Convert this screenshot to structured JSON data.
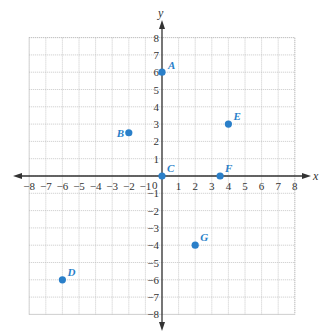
{
  "chart_data": {
    "type": "scatter",
    "title": "",
    "xlabel": "x",
    "ylabel": "y",
    "xlim": [
      -8,
      8
    ],
    "ylim": [
      -8,
      8
    ],
    "grid": true,
    "x_ticks": [
      -8,
      -7,
      -6,
      -5,
      -4,
      -3,
      -2,
      -1,
      1,
      2,
      3,
      4,
      5,
      6,
      7,
      8
    ],
    "y_ticks": [
      8,
      7,
      6,
      5,
      4,
      3,
      2,
      1,
      -1,
      -2,
      -3,
      -4,
      -5,
      -6,
      -7,
      -8
    ],
    "origin_label": "0",
    "series": [
      {
        "name": "points",
        "color": "#2a7fc9",
        "points": [
          {
            "label": "A",
            "x": 0,
            "y": 6
          },
          {
            "label": "B",
            "x": -2,
            "y": 2.5
          },
          {
            "label": "C",
            "x": 0,
            "y": 0
          },
          {
            "label": "D",
            "x": -6,
            "y": -6
          },
          {
            "label": "E",
            "x": 4,
            "y": 3
          },
          {
            "label": "F",
            "x": 3.5,
            "y": 0
          },
          {
            "label": "G",
            "x": 2,
            "y": -4
          }
        ]
      }
    ]
  },
  "colors": {
    "point": "#2a7fc9",
    "axis": "#333333",
    "grid": "#bbbbbb"
  }
}
